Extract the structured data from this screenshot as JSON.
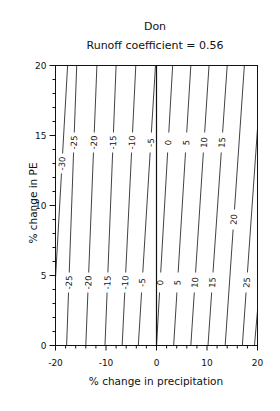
{
  "chart_data": {
    "type": "contour",
    "title": "Don",
    "subtitle": "Runoff coefficient = 0.56",
    "xlabel": "% change in precipitation",
    "ylabel": "% change in PE",
    "xlim": [
      -20,
      20
    ],
    "ylim": [
      0,
      20
    ],
    "x_ticks": [
      -20,
      -10,
      0,
      10,
      20
    ],
    "y_ticks": [
      0,
      5,
      10,
      15,
      20
    ],
    "reference_line": {
      "x": 0
    },
    "contour_levels": [
      -35,
      -30,
      -25,
      -20,
      -15,
      -10,
      -5,
      0,
      5,
      10,
      15,
      20,
      25,
      30
    ],
    "contours": [
      {
        "level": -30,
        "label": "-30",
        "points": [
          [
            -20,
            4.8
          ],
          [
            -17.6,
            20
          ]
        ]
      },
      {
        "level": -25,
        "label": "-25",
        "points": [
          [
            -17.8,
            0
          ],
          [
            -15.8,
            20
          ]
        ]
      },
      {
        "level": -20,
        "label": "-20",
        "points": [
          [
            -14.0,
            0
          ],
          [
            -11.8,
            20
          ]
        ]
      },
      {
        "level": -15,
        "label": "-15",
        "points": [
          [
            -10.2,
            0
          ],
          [
            -8.0,
            20
          ]
        ]
      },
      {
        "level": -10,
        "label": "-10",
        "points": [
          [
            -6.8,
            0
          ],
          [
            -4.1,
            20
          ]
        ]
      },
      {
        "level": -5,
        "label": "-5",
        "points": [
          [
            -3.6,
            0
          ],
          [
            -0.2,
            20
          ]
        ]
      },
      {
        "level": 0,
        "label": "0",
        "points": [
          [
            0,
            0
          ],
          [
            3.2,
            20
          ]
        ]
      },
      {
        "level": 5,
        "label": "5",
        "points": [
          [
            3.4,
            0
          ],
          [
            6.8,
            20
          ]
        ]
      },
      {
        "level": 10,
        "label": "10",
        "points": [
          [
            6.8,
            0
          ],
          [
            10.4,
            20
          ]
        ]
      },
      {
        "level": 15,
        "label": "15",
        "points": [
          [
            10.2,
            0
          ],
          [
            14.0,
            20
          ]
        ]
      },
      {
        "level": 20,
        "label": "20",
        "points": [
          [
            13.6,
            0
          ],
          [
            17.4,
            20
          ]
        ]
      },
      {
        "level": 25,
        "label": "25",
        "points": [
          [
            17.0,
            0
          ],
          [
            20,
            15.5
          ]
        ]
      },
      {
        "level": 30,
        "label": "",
        "points": [
          [
            19.4,
            0
          ],
          [
            20,
            2.5
          ]
        ]
      }
    ],
    "grid": false,
    "legend": null
  }
}
